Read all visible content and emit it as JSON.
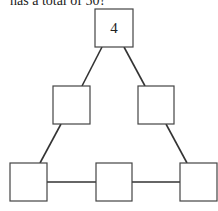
{
  "caption": "has a total of 50?",
  "diagram": {
    "type": "number-triangle",
    "boxes": [
      {
        "id": "top",
        "value": "4",
        "x": 95,
        "y": 9,
        "w": 38,
        "h": 38
      },
      {
        "id": "middle-left",
        "value": "",
        "x": 53,
        "y": 86,
        "w": 37,
        "h": 38
      },
      {
        "id": "middle-right",
        "value": "",
        "x": 138,
        "y": 86,
        "w": 36,
        "h": 38
      },
      {
        "id": "bottom-left",
        "value": "",
        "x": 10,
        "y": 163,
        "w": 37,
        "h": 38
      },
      {
        "id": "bottom-middle",
        "value": "",
        "x": 96,
        "y": 163,
        "w": 36,
        "h": 38
      },
      {
        "id": "bottom-right",
        "value": "",
        "x": 180,
        "y": 163,
        "w": 37,
        "h": 38
      }
    ]
  }
}
